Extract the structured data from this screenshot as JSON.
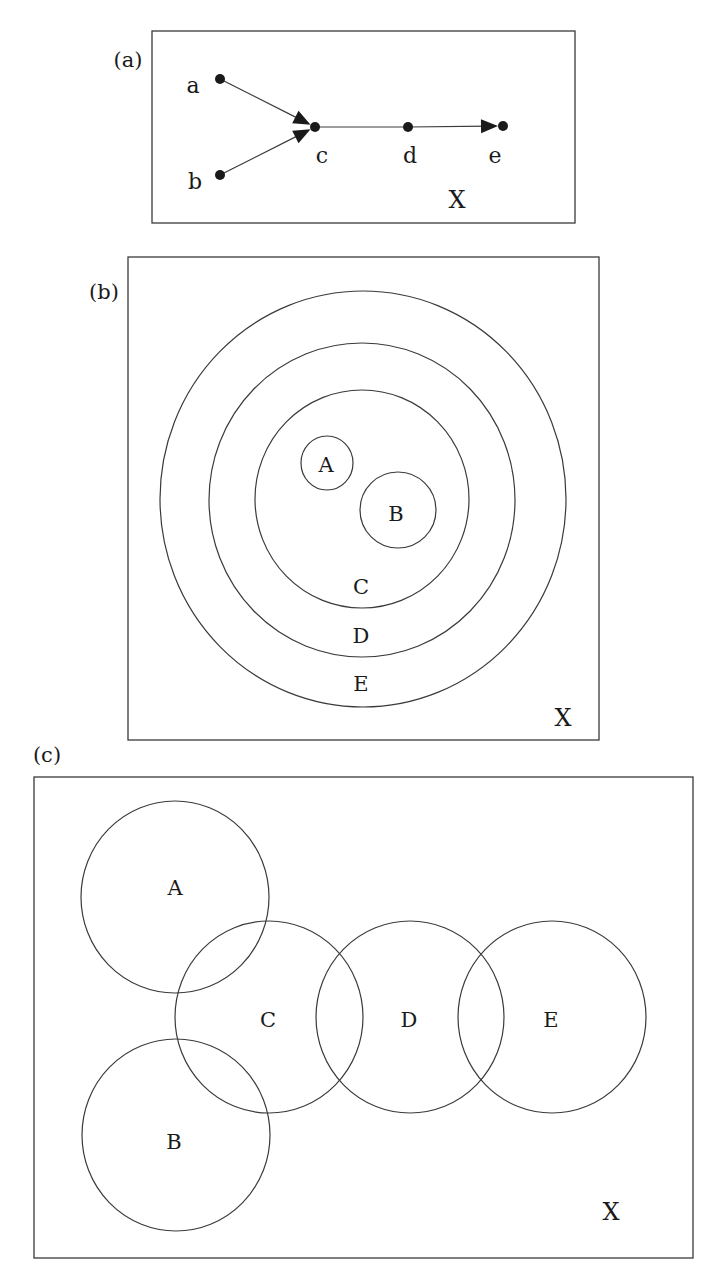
{
  "figure": {
    "panels": [
      {
        "id": "a",
        "label": "(a)",
        "label_pos": [
          128,
          60
        ],
        "box": {
          "x": 152,
          "y": 31,
          "w": 423,
          "h": 192
        },
        "universe": {
          "text": "X",
          "pos": [
            457,
            200
          ]
        },
        "nodes": [
          {
            "id": "a",
            "text": "a",
            "pos": [
              220,
              79
            ],
            "label_pos": [
              193,
              85
            ]
          },
          {
            "id": "b",
            "text": "b",
            "pos": [
              220,
              175
            ],
            "label_pos": [
              195,
              181
            ]
          },
          {
            "id": "c",
            "text": "c",
            "pos": [
              315,
              127
            ],
            "label_pos": [
              322,
              155
            ]
          },
          {
            "id": "d",
            "text": "d",
            "pos": [
              408,
              127
            ],
            "label_pos": [
              410,
              155
            ]
          },
          {
            "id": "e",
            "text": "e",
            "pos": [
              503,
              126
            ],
            "label_pos": [
              495,
              155
            ]
          }
        ],
        "edges": [
          {
            "from": "a",
            "to": "c",
            "arrow": true
          },
          {
            "from": "b",
            "to": "c",
            "arrow": true
          },
          {
            "from": "c",
            "to": "d",
            "arrow": false
          },
          {
            "from": "d",
            "to": "e",
            "arrow": true
          }
        ]
      },
      {
        "id": "b",
        "label": "(b)",
        "label_pos": [
          104,
          292
        ],
        "box": {
          "x": 128,
          "y": 257,
          "w": 471,
          "h": 483
        },
        "universe": {
          "text": "X",
          "pos": [
            563,
            718
          ]
        },
        "sets": [
          {
            "name": "E",
            "shape": "ellipse",
            "cx": 363,
            "cy": 499,
            "rx": 203,
            "ry": 208,
            "label_pos": [
              361,
              684
            ]
          },
          {
            "name": "D",
            "shape": "ellipse",
            "cx": 362,
            "cy": 500,
            "rx": 153,
            "ry": 157,
            "label_pos": [
              361,
              636
            ]
          },
          {
            "name": "C",
            "shape": "ellipse",
            "cx": 362,
            "cy": 499,
            "rx": 107,
            "ry": 109,
            "label_pos": [
              361,
              587
            ]
          },
          {
            "name": "A",
            "shape": "ellipse",
            "cx": 327,
            "cy": 463,
            "rx": 26,
            "ry": 27,
            "label_pos": [
              326,
              465
            ]
          },
          {
            "name": "B",
            "shape": "ellipse",
            "cx": 398,
            "cy": 510,
            "rx": 38,
            "ry": 38,
            "label_pos": [
              396,
              514
            ]
          }
        ]
      },
      {
        "id": "c",
        "label": "(c)",
        "label_pos": [
          47,
          755
        ],
        "box": {
          "x": 34,
          "y": 777,
          "w": 659,
          "h": 481
        },
        "universe": {
          "text": "X",
          "pos": [
            611,
            1212
          ]
        },
        "sets": [
          {
            "name": "A",
            "shape": "ellipse",
            "cx": 175,
            "cy": 897,
            "rx": 94,
            "ry": 96,
            "label_pos": [
              175,
              888
            ]
          },
          {
            "name": "C",
            "shape": "ellipse",
            "cx": 269,
            "cy": 1017,
            "rx": 94,
            "ry": 96,
            "label_pos": [
              268,
              1020
            ]
          },
          {
            "name": "D",
            "shape": "ellipse",
            "cx": 410,
            "cy": 1017,
            "rx": 94,
            "ry": 96,
            "label_pos": [
              409,
              1020
            ]
          },
          {
            "name": "E",
            "shape": "ellipse",
            "cx": 552,
            "cy": 1017,
            "rx": 94,
            "ry": 96,
            "label_pos": [
              551,
              1020
            ]
          },
          {
            "name": "B",
            "shape": "ellipse",
            "cx": 176,
            "cy": 1135,
            "rx": 94,
            "ry": 96,
            "label_pos": [
              174,
              1142
            ]
          }
        ]
      }
    ]
  },
  "colors": {
    "stroke": "#3a3a3a",
    "node_fill": "#1a1a1a",
    "background": "#ffffff"
  }
}
